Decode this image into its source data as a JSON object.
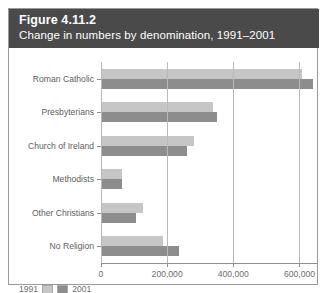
{
  "figure": {
    "title": "Figure 4.11.2",
    "subtitle": "Change in numbers by denomination, 1991–2001"
  },
  "legend": {
    "items": [
      {
        "label": "1991",
        "color": "#c6c6c6"
      },
      {
        "label": "2001",
        "color": "#8d8d8d"
      }
    ]
  },
  "axis": {
    "ticks": [
      "0",
      "200,000",
      "400,000",
      "600,000"
    ]
  },
  "chart_data": {
    "type": "bar",
    "orientation": "horizontal",
    "title": "Figure 4.11.2",
    "subtitle": "Change in numbers by denomination, 1991–2001",
    "xlabel": "",
    "ylabel": "",
    "xlim": [
      0,
      650000
    ],
    "xticks": [
      0,
      200000,
      400000,
      600000
    ],
    "xticklabels": [
      "0",
      "200,000",
      "400,000",
      "600,000"
    ],
    "grid": true,
    "legend_position": "bottom-left",
    "categories": [
      "Roman Catholic",
      "Presbyterians",
      "Church of Ireland",
      "Methodists",
      "Other Christians",
      "No Religion"
    ],
    "series": [
      {
        "name": "1991",
        "color": "#c6c6c6",
        "values": [
          605000,
          336000,
          279000,
          60000,
          123000,
          183000
        ]
      },
      {
        "name": "2001",
        "color": "#8d8d8d",
        "values": [
          638000,
          348000,
          258000,
          60000,
          103000,
          233000
        ]
      }
    ]
  }
}
